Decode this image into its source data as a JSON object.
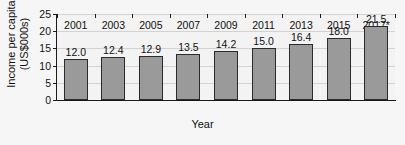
{
  "chart_data": {
    "type": "bar",
    "title": "",
    "xlabel": "Year",
    "ylabel": "Income per capita (US$000s)",
    "ylabel_lines": [
      "Income per capita",
      "(US$000s)"
    ],
    "categories": [
      "2001",
      "2003",
      "2005",
      "2007",
      "2009",
      "2011",
      "2013",
      "2015",
      "2017*"
    ],
    "values": [
      12.0,
      12.4,
      12.9,
      13.5,
      14.2,
      15.0,
      16.4,
      18.0,
      21.5
    ],
    "value_labels": [
      "12.0",
      "12.4",
      "12.9",
      "13.5",
      "14.2",
      "15.0",
      "16.4",
      "18.0",
      "21.5"
    ],
    "ylim": [
      0,
      25
    ],
    "yticks": [
      0,
      5,
      10,
      15,
      20,
      25
    ],
    "ytick_labels": [
      "0",
      "5",
      "10",
      "15",
      "20",
      "25"
    ],
    "grid": true,
    "legend": "none",
    "series": [
      {
        "name": "Income per capita",
        "values": [
          12.0,
          12.4,
          12.9,
          13.5,
          14.2,
          15.0,
          16.4,
          18.0,
          21.5
        ]
      }
    ],
    "colors": {
      "bar_fill": "#9a9a9a",
      "bar_border": "#2b2b2b",
      "axis": "#1a1a1a",
      "gridline": "#d2d2d2",
      "plot_background": "#f3f3f3",
      "figure_background": "#f6f6f6",
      "text": "#111111"
    }
  }
}
